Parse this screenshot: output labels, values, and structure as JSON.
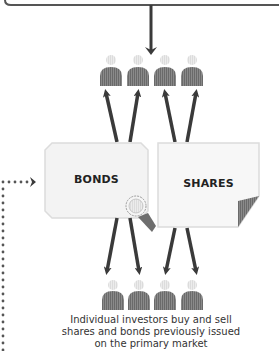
{
  "diagram": {
    "type": "secondary-market-flow",
    "colors": {
      "line": "#3a3a3a",
      "person_body": "#7a7a7a",
      "person_head": "#e6e6e6",
      "box_fill": "#f3f3f3",
      "box_stroke": "#dcdcdc",
      "corner_fold": "#6e6e6e",
      "dotted": "#555555"
    },
    "boxes": [
      {
        "id": "bonds",
        "label": "BONDS"
      },
      {
        "id": "shares",
        "label": "SHARES"
      }
    ],
    "investor_groups": [
      {
        "position": "top",
        "count": 4
      },
      {
        "position": "bottom",
        "count": 4
      }
    ],
    "caption": {
      "line1": "Individual investors buy and sell",
      "line2": "shares and bonds previously issued",
      "line3": "on the primary market"
    }
  }
}
